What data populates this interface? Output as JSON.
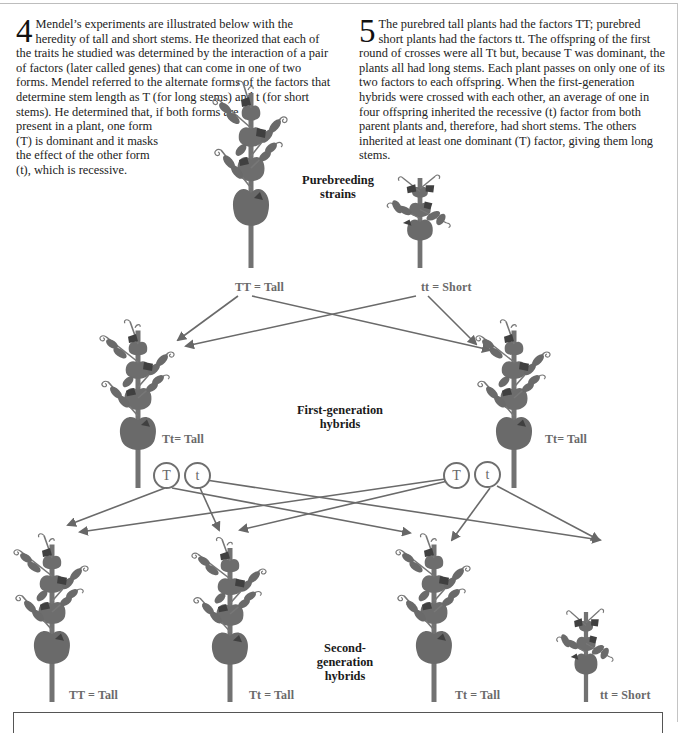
{
  "paragraphs": {
    "p4": {
      "number": "4",
      "text_main": "Mendel’s experiments are illustrated below with the heredity of tall and short stems. He theorized that each of the traits he studied was determined by the interaction of a pair of factors (later called genes) that can come in one of two forms. Mendel referred to the alternate forms of the factors that determine stem length as T (for long stems) and t (for short stems). He determined that, if both forms are",
      "text_narrow": "present in a plant, one form (T) is dominant and it masks the effect of the other form (t), which is recessive."
    },
    "p5": {
      "number": "5",
      "text": "The purebred tall plants had the factors TT; purebred short plants had the factors tt. The offspring of the first round of crosses were all Tt but, because T was dominant, the plants all had long stems. Each plant passes on only one of its two factors to each offspring. When the first-generation hybrids were crossed with each other, an average of one in four offspring inherited the recessive (t) factor from both parent plants and, therefore, had short stems. The others inherited at least one dominant (T) factor, giving them long stems."
    }
  },
  "diagram": {
    "generations": [
      {
        "label_line1": "Purebreeding",
        "label_line2": "strains"
      },
      {
        "label_line1": "First-generation",
        "label_line2": "hybrids"
      },
      {
        "label_line1": "Second-",
        "label_line2": "generation",
        "label_line3": "hybrids"
      }
    ],
    "parents": [
      {
        "genotype": "TT = Tall"
      },
      {
        "genotype": "tt = Short"
      }
    ],
    "f1": [
      {
        "genotype": "Tt= Tall",
        "factor_a": "T",
        "factor_b": "t"
      },
      {
        "genotype": "Tt= Tall",
        "factor_a": "T",
        "factor_b": "t"
      }
    ],
    "f2": [
      {
        "genotype": "TT = Tall"
      },
      {
        "genotype": "Tt = Tall"
      },
      {
        "genotype": "Tt = Tall"
      },
      {
        "genotype": "tt = Short"
      }
    ],
    "colors": {
      "plant": "#6e6e6e",
      "plant_dark": "#4a4a4a",
      "arrow": "#6a6a6a",
      "text": "#222222",
      "label_gray": "#6a6a6a"
    }
  }
}
